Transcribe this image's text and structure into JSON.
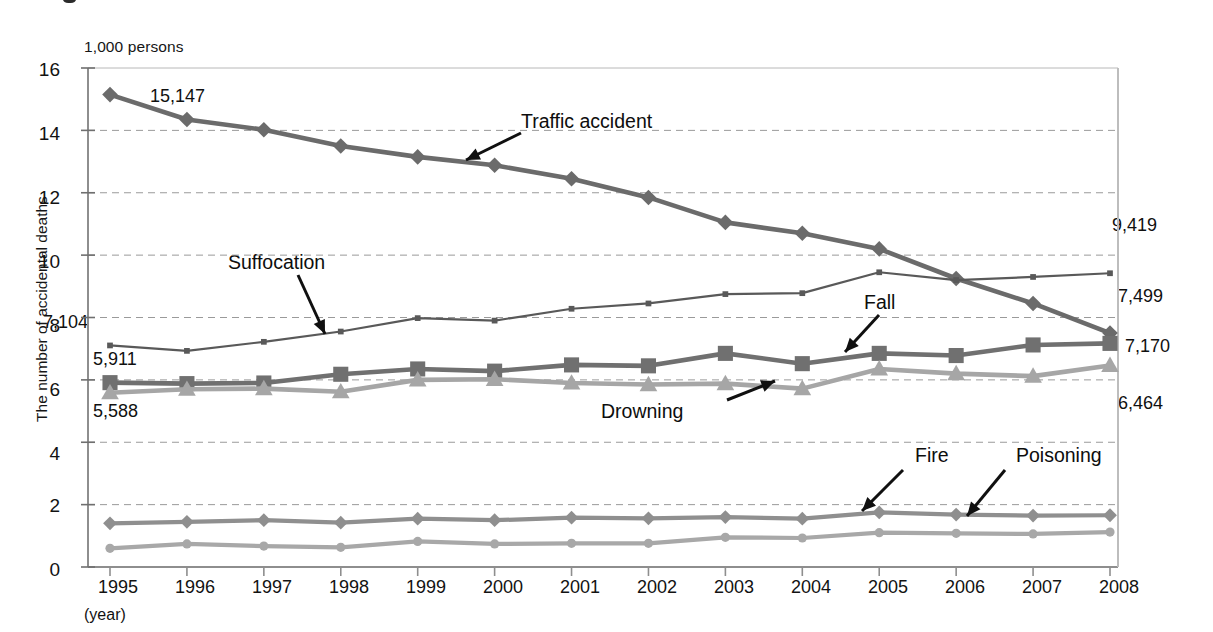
{
  "chart_data": {
    "type": "line",
    "title": "",
    "subtitle": "",
    "unit_label": "1,000 persons",
    "ylabel": "The number of accidental deaths",
    "xlabel": "(year)",
    "ylim": [
      0,
      16
    ],
    "yticks": [
      0,
      2,
      4,
      6,
      8,
      10,
      12,
      14,
      16
    ],
    "grid": "horizontal-dashed",
    "legend_position": "inline-annotations",
    "categories": [
      "1995",
      "1996",
      "1997",
      "1998",
      "1999",
      "2000",
      "2001",
      "2002",
      "2003",
      "2004",
      "2005",
      "2006",
      "2007",
      "2008"
    ],
    "series": [
      {
        "name": "Traffic accident",
        "marker": "diamond",
        "color": "#6b6b6b",
        "values": [
          15.147,
          14.35,
          14.02,
          13.5,
          13.15,
          12.88,
          12.45,
          11.85,
          11.05,
          10.7,
          10.2,
          9.25,
          8.45,
          7.499
        ]
      },
      {
        "name": "Suffocation",
        "marker": "square-small",
        "color": "#595959",
        "values": [
          7.104,
          6.93,
          7.22,
          7.55,
          7.98,
          7.9,
          8.28,
          8.45,
          8.75,
          8.78,
          9.45,
          9.2,
          9.3,
          9.419
        ]
      },
      {
        "name": "Fall",
        "marker": "square",
        "color": "#707070",
        "values": [
          5.911,
          5.88,
          5.9,
          6.18,
          6.35,
          6.28,
          6.48,
          6.45,
          6.85,
          6.52,
          6.85,
          6.78,
          7.12,
          7.17
        ]
      },
      {
        "name": "Drowning",
        "marker": "triangle",
        "color": "#a6a6a6",
        "values": [
          5.588,
          5.7,
          5.72,
          5.62,
          6.0,
          6.02,
          5.9,
          5.85,
          5.88,
          5.72,
          6.35,
          6.2,
          6.12,
          6.464
        ]
      },
      {
        "name": "Fire",
        "marker": "diamond",
        "color": "#8f8f8f",
        "values": [
          1.4,
          1.45,
          1.5,
          1.42,
          1.55,
          1.5,
          1.58,
          1.56,
          1.6,
          1.55,
          1.75,
          1.68,
          1.65,
          1.66
        ]
      },
      {
        "name": "Poisoning",
        "marker": "circle",
        "color": "#a8a8a8",
        "values": [
          0.6,
          0.74,
          0.67,
          0.63,
          0.82,
          0.74,
          0.76,
          0.76,
          0.95,
          0.93,
          1.1,
          1.08,
          1.06,
          1.12
        ]
      }
    ],
    "value_labels": [
      {
        "id": "traffic-start",
        "text": "15,147"
      },
      {
        "id": "suffocation-start",
        "text": "7,104"
      },
      {
        "id": "fall-start",
        "text": "5,911"
      },
      {
        "id": "drowning-start",
        "text": "5,588"
      },
      {
        "id": "suffocation-end",
        "text": "9,419"
      },
      {
        "id": "traffic-end",
        "text": "7,499"
      },
      {
        "id": "fall-end",
        "text": "7,170"
      },
      {
        "id": "drowning-end",
        "text": "6,464"
      }
    ],
    "annotations": [
      {
        "id": "traffic-accident",
        "text": "Traffic accident"
      },
      {
        "id": "suffocation",
        "text": "Suffocation"
      },
      {
        "id": "fall",
        "text": "Fall"
      },
      {
        "id": "drowning",
        "text": "Drowning"
      },
      {
        "id": "fire",
        "text": "Fire"
      },
      {
        "id": "poisoning",
        "text": "Poisoning"
      }
    ]
  }
}
